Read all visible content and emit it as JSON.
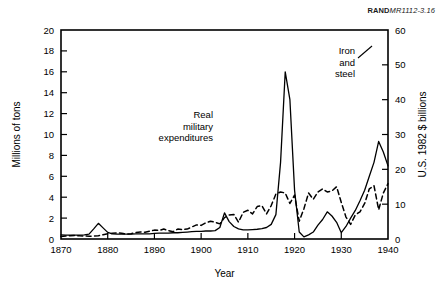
{
  "credit": {
    "org": "RAND",
    "doc": "MR1112-3.16"
  },
  "chart_data": {
    "type": "line",
    "title": "",
    "xlabel": "Year",
    "ylabel": "Millions of tons",
    "y2label": "U.S. 1982 $ billions",
    "xlim": [
      1870,
      1940
    ],
    "ylim": [
      0,
      20
    ],
    "y2lim": [
      0,
      60
    ],
    "xticks": [
      1870,
      1880,
      1890,
      1900,
      1910,
      1920,
      1930,
      1940
    ],
    "yticks": [
      0,
      2,
      4,
      6,
      8,
      10,
      12,
      14,
      16,
      18,
      20
    ],
    "y2ticks": [
      0,
      10,
      20,
      30,
      40,
      50,
      60
    ],
    "grid": false,
    "legend_position": "inline-annotations",
    "annotations": [
      {
        "name": "real-military-expenditures",
        "lines": [
          "Real",
          "military",
          "expenditures"
        ],
        "align": "right",
        "x": 213,
        "y": 118
      },
      {
        "name": "iron-and-steel",
        "lines": [
          "Iron",
          "and",
          "steel"
        ],
        "align": "right",
        "x": 355,
        "y": 54
      }
    ],
    "series": [
      {
        "name": "Real military expenditures",
        "style": "solid",
        "axis": "right",
        "units": "U.S. 1982 $ billions",
        "x": [
          1870,
          1871,
          1872,
          1873,
          1874,
          1875,
          1876,
          1877,
          1878,
          1879,
          1880,
          1881,
          1882,
          1883,
          1884,
          1885,
          1886,
          1887,
          1888,
          1889,
          1890,
          1891,
          1892,
          1893,
          1894,
          1895,
          1896,
          1897,
          1898,
          1899,
          1900,
          1901,
          1902,
          1903,
          1904,
          1905,
          1906,
          1907,
          1908,
          1909,
          1910,
          1911,
          1912,
          1913,
          1914,
          1915,
          1916,
          1917,
          1918,
          1919,
          1920,
          1921,
          1922,
          1923,
          1924,
          1925,
          1926,
          1927,
          1928,
          1929,
          1930,
          1931,
          1932,
          1933,
          1934,
          1935,
          1936,
          1937,
          1938,
          1939,
          1940
        ],
        "y": [
          1.2,
          1.1,
          1.1,
          1.1,
          1.1,
          1.2,
          1.4,
          2.9,
          4.5,
          3.2,
          1.9,
          1.5,
          1.4,
          1.4,
          1.4,
          1.4,
          1.5,
          1.5,
          1.5,
          1.5,
          1.6,
          1.7,
          1.7,
          1.7,
          1.8,
          1.8,
          1.9,
          2.0,
          2.1,
          2.2,
          2.2,
          2.3,
          2.3,
          2.4,
          3.3,
          7.5,
          5.0,
          3.6,
          2.9,
          2.6,
          2.6,
          2.7,
          2.8,
          3.0,
          3.3,
          4.2,
          7.0,
          22.0,
          48.0,
          40.0,
          14.0,
          2.0,
          0.6,
          1.2,
          2.0,
          4.0,
          5.6,
          7.8,
          6.6,
          4.8,
          1.8,
          3.6,
          6.0,
          8.2,
          11.0,
          14.0,
          18.0,
          22.0,
          28.0,
          25.0,
          21.0
        ]
      },
      {
        "name": "Iron and steel",
        "style": "dashed",
        "axis": "left",
        "units": "Millions of tons",
        "x": [
          1870,
          1871,
          1872,
          1873,
          1874,
          1875,
          1876,
          1877,
          1878,
          1879,
          1880,
          1881,
          1882,
          1883,
          1884,
          1885,
          1886,
          1887,
          1888,
          1889,
          1890,
          1891,
          1892,
          1893,
          1894,
          1895,
          1896,
          1897,
          1898,
          1899,
          1900,
          1901,
          1902,
          1903,
          1904,
          1905,
          1906,
          1907,
          1908,
          1909,
          1910,
          1911,
          1912,
          1913,
          1914,
          1915,
          1916,
          1917,
          1918,
          1919,
          1920,
          1921,
          1922,
          1923,
          1924,
          1925,
          1926,
          1927,
          1928,
          1929,
          1930,
          1931,
          1932,
          1933,
          1934,
          1935,
          1936,
          1937,
          1938,
          1939,
          1940
        ],
        "y": [
          0.25,
          0.28,
          0.32,
          0.33,
          0.3,
          0.28,
          0.27,
          0.28,
          0.32,
          0.4,
          0.5,
          0.55,
          0.58,
          0.55,
          0.48,
          0.5,
          0.62,
          0.68,
          0.65,
          0.75,
          0.85,
          0.82,
          0.95,
          0.8,
          0.7,
          0.95,
          0.9,
          0.95,
          1.15,
          1.35,
          1.3,
          1.55,
          1.7,
          1.6,
          1.45,
          2.05,
          2.3,
          2.35,
          1.6,
          2.55,
          2.75,
          2.4,
          3.1,
          3.2,
          2.4,
          3.2,
          4.3,
          4.5,
          4.4,
          3.4,
          4.2,
          1.7,
          2.9,
          4.4,
          3.8,
          4.5,
          4.8,
          4.5,
          4.6,
          5.0,
          3.5,
          2.1,
          1.4,
          2.3,
          2.6,
          3.4,
          4.8,
          5.1,
          2.8,
          4.4,
          5.3
        ]
      }
    ]
  }
}
